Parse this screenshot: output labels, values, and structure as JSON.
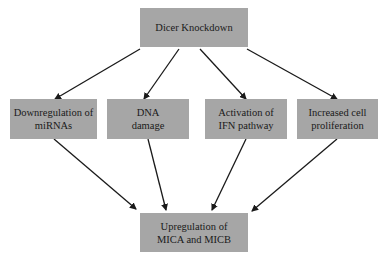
{
  "diagram": {
    "type": "flowchart",
    "colors": {
      "box_fill": "#a6a6a6",
      "arrow": "#1a1a1a",
      "text": "#1a1a1a",
      "background": "#ffffff"
    },
    "nodes": {
      "top": {
        "id": "dicer-knockdown",
        "label": "Dicer Knockdown"
      },
      "middle": [
        {
          "id": "downregulation-mirnas",
          "label": "Downregulation of miRNAs"
        },
        {
          "id": "dna-damage",
          "label": "DNA damage"
        },
        {
          "id": "ifn-activation",
          "label": "Activation of  IFN pathway"
        },
        {
          "id": "cell-proliferation",
          "label": "Increased cell proliferation"
        }
      ],
      "bottom": {
        "id": "mica-micb-upregulation",
        "label": "Upregulation of MICA and MICB"
      }
    },
    "edges": [
      {
        "from": "dicer-knockdown",
        "to": "downregulation-mirnas"
      },
      {
        "from": "dicer-knockdown",
        "to": "dna-damage"
      },
      {
        "from": "dicer-knockdown",
        "to": "ifn-activation"
      },
      {
        "from": "dicer-knockdown",
        "to": "cell-proliferation"
      },
      {
        "from": "downregulation-mirnas",
        "to": "mica-micb-upregulation"
      },
      {
        "from": "dna-damage",
        "to": "mica-micb-upregulation"
      },
      {
        "from": "ifn-activation",
        "to": "mica-micb-upregulation"
      },
      {
        "from": "cell-proliferation",
        "to": "mica-micb-upregulation"
      }
    ]
  }
}
